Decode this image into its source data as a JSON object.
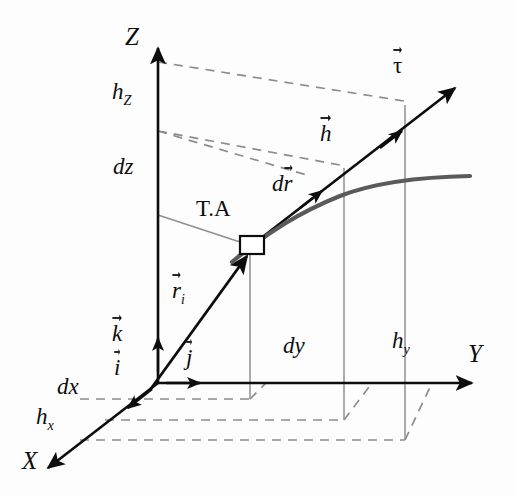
{
  "figure": {
    "kind": "3d-vector-calculus-diagram",
    "background_color": "#fdfdfd",
    "ink_color": "#0d0d0d",
    "curve_color": "#5a5a5a",
    "dash_color": "#8c8c8c",
    "thin_color": "#8f8f8f"
  },
  "axes": {
    "z_label": "Z",
    "y_label": "Y",
    "x_label": "X"
  },
  "labels": {
    "h_z": "h",
    "h_z_sub": "Z",
    "dz": "dz",
    "ta": "T.A",
    "dy": "dy",
    "h_y": "h",
    "h_y_sub": "y",
    "dx": "dx",
    "h_x": "h",
    "h_x_sub": "x"
  },
  "vectors": {
    "tau": "τ",
    "h": "h",
    "dr_prefix": "d",
    "dr_glyph": "r",
    "r_i": "r",
    "r_i_sub": "i",
    "k": "k",
    "i": "i",
    "j": "j"
  },
  "markers": {
    "tangent_point": "tangent-point-square"
  }
}
